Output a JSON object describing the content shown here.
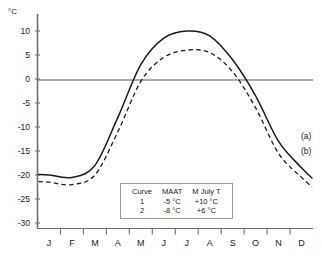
{
  "axis": {
    "unit_label": "°C",
    "y_ticks": [
      10,
      5,
      0,
      -5,
      -10,
      -15,
      -20,
      -25,
      -30
    ],
    "y_tick_labels": [
      "10",
      "5",
      "0",
      "-5",
      "-10",
      "-15",
      "-20",
      "-25",
      "-30"
    ],
    "x_tick_labels": [
      "J",
      "F",
      "M",
      "A",
      "M",
      "J",
      "J",
      "A",
      "S",
      "O",
      "N",
      "D"
    ]
  },
  "curve_tags": {
    "a": "(a)",
    "b": "(b)"
  },
  "legend": {
    "headers": [
      "Curve",
      "MAAT",
      "M July T"
    ],
    "rows": [
      [
        "1",
        "-5 °C",
        "+10 °C"
      ],
      [
        "2",
        "-8 °C",
        "+6 °C"
      ]
    ]
  },
  "colors": {
    "curve": "#1a1a1a",
    "axis": "#6e6e6e",
    "zero_line": "#8c8c8c",
    "legend_border": "#9a9a9a",
    "background": "#ffffff"
  },
  "chart_data": {
    "type": "line",
    "title": "",
    "xlabel": "",
    "ylabel": "°C",
    "ylim": [
      -30,
      10
    ],
    "grid": false,
    "legend_position": "inside-bottom-center",
    "categories": [
      "J",
      "F",
      "M",
      "A",
      "M",
      "J",
      "J",
      "A",
      "S",
      "O",
      "N",
      "D"
    ],
    "zero_line": 0,
    "series": [
      {
        "name": "1",
        "tag": "(a)",
        "style": "solid",
        "maat": -5,
        "m_july_t": 10,
        "values": [
          -20.0,
          -20.5,
          -18.0,
          -8.0,
          3.0,
          8.5,
          10.0,
          9.0,
          4.0,
          -3.5,
          -13.0,
          -18.5
        ]
      },
      {
        "name": "2",
        "tag": "(b)",
        "style": "dashed",
        "maat": -8,
        "m_july_t": 6,
        "values": [
          -21.5,
          -22.0,
          -20.0,
          -11.0,
          -0.5,
          4.5,
          6.0,
          5.5,
          1.5,
          -6.0,
          -15.5,
          -20.5
        ]
      }
    ]
  }
}
